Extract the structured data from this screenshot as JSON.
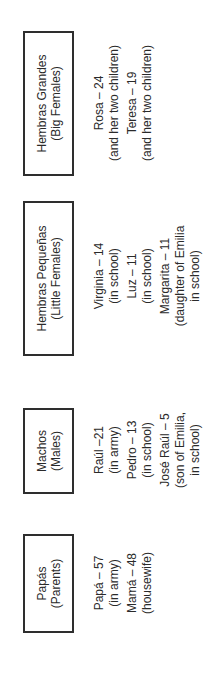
{
  "diagram": {
    "orientation": "rotated-90-counterclockwise",
    "groups": [
      {
        "title": "Papás",
        "subtitle": "(Parents)",
        "members": [
          {
            "name": "Papá – 57",
            "note": "(in army)"
          },
          {
            "name": "Mamá – 48",
            "note": "(housewife)"
          }
        ]
      },
      {
        "title": "Machos",
        "subtitle": "(Males)",
        "members": [
          {
            "name": "Raúl –21",
            "note": "(in army)"
          },
          {
            "name": "Pedro – 13",
            "note": "(in school)"
          },
          {
            "name": "José Raúl – 5",
            "note": "(son of Emilia,",
            "note2": "in school)"
          }
        ]
      },
      {
        "title": "Hembras Pequeñas",
        "subtitle": "(Little Females)",
        "members": [
          {
            "name": "Virginia – 14",
            "note": "(in school)"
          },
          {
            "name": "Luz – 11",
            "note": "(in school)"
          },
          {
            "name": "Margarita – 11",
            "note": "(daughter of Emilia",
            "note2": "in school)"
          }
        ]
      },
      {
        "title": "Hembras Grandes",
        "subtitle": "(Big Females)",
        "members": [
          {
            "name": "Rosa – 24",
            "note": "(and her two children)"
          },
          {
            "name": "Teresa – 19",
            "note": "(and her two children)"
          }
        ]
      }
    ]
  }
}
